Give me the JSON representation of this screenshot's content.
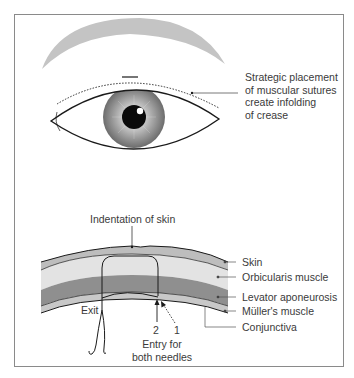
{
  "figure": {
    "top_panel": {
      "annotation_lines": [
        "Strategic placement",
        "of muscular sutures",
        "create infolding",
        "of crease"
      ]
    },
    "bottom_panel": {
      "top_label": "Indentation of skin",
      "layer_labels": [
        "Skin",
        "Orbicularis muscle",
        "Levator aponeurosis",
        "Müller's muscle",
        "Conjunctiva"
      ],
      "exit_label": "Exit",
      "needle_numbers": [
        "2",
        "1"
      ],
      "entry_label_lines": [
        "Entry for",
        "both needles"
      ]
    },
    "colors": {
      "eyebrow": "#c4c4c4",
      "skin_layer": "#bdbdbd",
      "orbicularis_layer": "#e3e3e3",
      "levator_layer": "#8f8f8f",
      "muller_layer": "#c8c8c8",
      "outline": "#1a1a1a",
      "frame": "#8a8a8a"
    }
  }
}
